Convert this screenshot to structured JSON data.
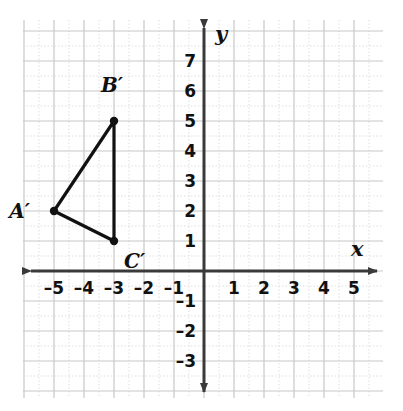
{
  "chart_data": {
    "type": "scatter",
    "title": "",
    "xlabel": "x",
    "ylabel": "y",
    "xlim": [
      -6,
      6
    ],
    "ylim": [
      -4,
      8
    ],
    "grid": true,
    "legend": null,
    "x_tick_labels": [
      "–5",
      "–4",
      "–3",
      "–2",
      "–1",
      "1",
      "2",
      "3",
      "4",
      "5"
    ],
    "x_tick_values": [
      -5,
      -4,
      -3,
      -2,
      -1,
      1,
      2,
      3,
      4,
      5
    ],
    "y_tick_labels": [
      "7",
      "6",
      "5",
      "4",
      "3",
      "2",
      "1",
      "–1",
      "–2",
      "–3"
    ],
    "y_tick_values": [
      7,
      6,
      5,
      4,
      3,
      2,
      1,
      -1,
      -2,
      -3
    ],
    "annotations": [
      {
        "label": "A′",
        "x": -5,
        "y": 2
      },
      {
        "label": "B′",
        "x": -3,
        "y": 5
      },
      {
        "label": "C′",
        "x": -3,
        "y": 1
      }
    ],
    "series": [
      {
        "name": "triangle A'B'C'",
        "type": "polygon",
        "closed": true,
        "points": [
          {
            "label": "A′",
            "x": -5,
            "y": 2
          },
          {
            "label": "B′",
            "x": -3,
            "y": 5
          },
          {
            "label": "C′",
            "x": -3,
            "y": 1
          }
        ]
      }
    ],
    "colors": {
      "shape": "#111111",
      "axis": "#3a3a3a",
      "grid_major": "#c8c8c8",
      "grid_minor": "#dedede",
      "background": "#ffffff"
    }
  },
  "axes": {
    "x_label": "x",
    "y_label": "y"
  },
  "ticks": {
    "x": [
      {
        "text": "–5",
        "value": -5
      },
      {
        "text": "–4",
        "value": -4
      },
      {
        "text": "–3",
        "value": -3
      },
      {
        "text": "–2",
        "value": -2
      },
      {
        "text": "–1",
        "value": -1
      },
      {
        "text": "1",
        "value": 1
      },
      {
        "text": "2",
        "value": 2
      },
      {
        "text": "3",
        "value": 3
      },
      {
        "text": "4",
        "value": 4
      },
      {
        "text": "5",
        "value": 5
      }
    ],
    "y": [
      {
        "text": "7",
        "value": 7
      },
      {
        "text": "6",
        "value": 6
      },
      {
        "text": "5",
        "value": 5
      },
      {
        "text": "4",
        "value": 4
      },
      {
        "text": "3",
        "value": 3
      },
      {
        "text": "2",
        "value": 2
      },
      {
        "text": "1",
        "value": 1
      },
      {
        "text": "–1",
        "value": -1
      },
      {
        "text": "–2",
        "value": -2
      },
      {
        "text": "–3",
        "value": -3
      }
    ]
  },
  "vertices": [
    {
      "name": "A-prime",
      "label": "A′",
      "x": -5,
      "y": 2
    },
    {
      "name": "B-prime",
      "label": "B′",
      "x": -3,
      "y": 5
    },
    {
      "name": "C-prime",
      "label": "C′",
      "x": -3,
      "y": 1
    }
  ]
}
